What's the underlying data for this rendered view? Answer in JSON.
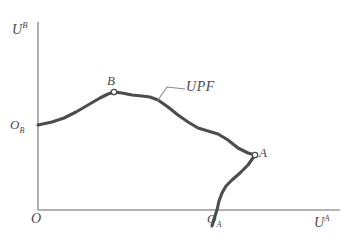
{
  "figure": {
    "type": "economics-diagram",
    "name": "Utility Possibility Frontier diagram",
    "background_color": "#ffffff",
    "axis_color": "#9a9a9a",
    "curve_color": "#4d4d4d",
    "leader_color": "#8c8c8c",
    "text_color": "#4a4a4a"
  },
  "axes": {
    "y_label_base": "U",
    "y_label_sup": "B",
    "x_label_base": "U",
    "x_label_sup": "A",
    "origin_label": "O",
    "x_axis": {
      "start_x": 38,
      "end_x": 340,
      "y": 210
    },
    "y_axis": {
      "x": 38,
      "start_y": 22,
      "end_y": 210
    }
  },
  "labels": {
    "ob_base": "O",
    "ob_sub": "B",
    "oa_base": "O",
    "oa_sub": "A",
    "point_b": "B",
    "point_a": "A",
    "curve_label": "UPF"
  },
  "chart_data": {
    "type": "line",
    "title": "",
    "xlabel": "U^A",
    "ylabel": "U^B",
    "grid": false,
    "legend": null,
    "annotations": [
      {
        "text": "B",
        "x": 114,
        "y": 92,
        "marker": "open-circle"
      },
      {
        "text": "A",
        "x": 255,
        "y": 155,
        "marker": "open-circle"
      },
      {
        "text": "O_B",
        "x": 38,
        "y": 125,
        "marker": "none"
      },
      {
        "text": "O_A",
        "x": 217,
        "y": 210,
        "marker": "none"
      },
      {
        "text": "UPF",
        "x": 188,
        "y": 89,
        "marker": "leader-line"
      }
    ],
    "series": [
      {
        "name": "UPF",
        "points": [
          [
            38,
            125
          ],
          [
            52,
            122
          ],
          [
            64,
            118
          ],
          [
            76,
            112
          ],
          [
            88,
            105
          ],
          [
            100,
            98
          ],
          [
            108,
            94
          ],
          [
            114,
            92
          ],
          [
            122,
            93
          ],
          [
            132,
            95
          ],
          [
            142,
            96
          ],
          [
            150,
            97
          ],
          [
            158,
            100
          ],
          [
            168,
            107
          ],
          [
            178,
            115
          ],
          [
            188,
            122
          ],
          [
            198,
            128
          ],
          [
            208,
            131
          ],
          [
            218,
            134
          ],
          [
            228,
            140
          ],
          [
            238,
            148
          ],
          [
            248,
            153
          ],
          [
            255,
            155
          ],
          [
            248,
            165
          ],
          [
            240,
            173
          ],
          [
            232,
            180
          ],
          [
            226,
            186
          ],
          [
            222,
            193
          ],
          [
            219,
            201
          ],
          [
            217,
            210
          ],
          [
            214,
            219
          ],
          [
            212,
            226
          ]
        ]
      }
    ],
    "leader_line": {
      "points": [
        [
          185,
          89
        ],
        [
          167,
          87
        ],
        [
          158,
          100
        ]
      ]
    }
  }
}
